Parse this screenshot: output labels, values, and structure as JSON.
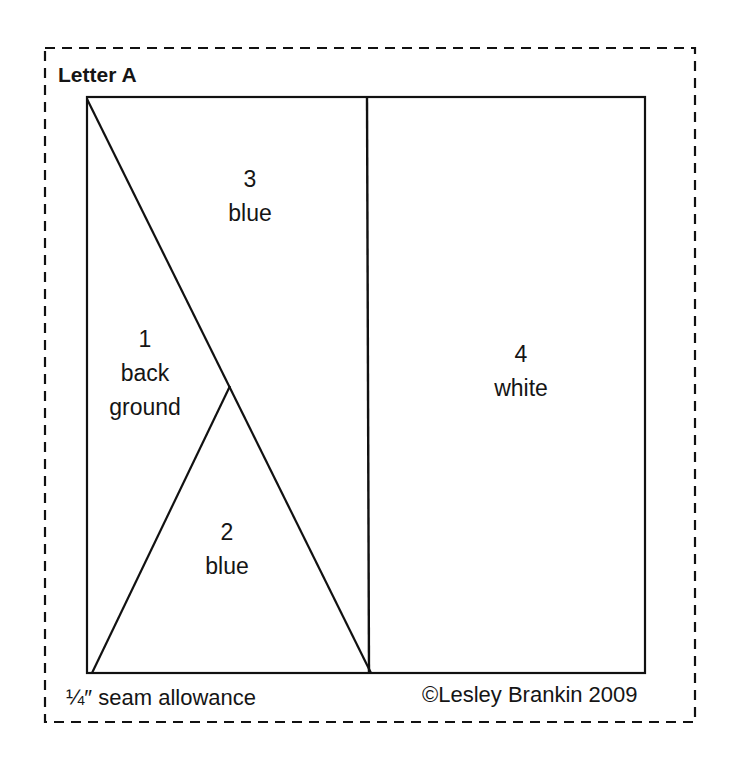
{
  "title": "Letter A",
  "pieces": [
    {
      "number": "1",
      "lines": [
        "back",
        "ground"
      ],
      "color": "background"
    },
    {
      "number": "2",
      "lines": [
        "blue"
      ],
      "color": "blue"
    },
    {
      "number": "3",
      "lines": [
        "blue"
      ],
      "color": "blue"
    },
    {
      "number": "4",
      "lines": [
        "white"
      ],
      "color": "white"
    }
  ],
  "footer": {
    "seam_allowance": "¼″ seam allowance",
    "copyright": "©Lesley Brankin 2009"
  },
  "colors": {
    "line": "#111111",
    "background": "#ffffff"
  }
}
